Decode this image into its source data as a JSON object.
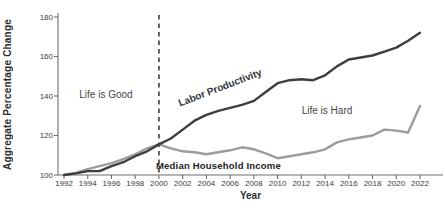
{
  "chart_data": {
    "type": "line",
    "title": "",
    "xlabel": "Year",
    "ylabel": "Aggregate Percentage Change",
    "xlim": [
      1992,
      2022
    ],
    "ylim": [
      100,
      180
    ],
    "grid": false,
    "legend": "inline-labels",
    "xticks": [
      1992,
      1994,
      1996,
      1998,
      2000,
      2002,
      2004,
      2006,
      2008,
      2010,
      2012,
      2014,
      2016,
      2018,
      2020,
      2022
    ],
    "yticks": [
      100,
      120,
      140,
      160,
      180
    ],
    "x": [
      1992,
      1993,
      1994,
      1995,
      1996,
      1997,
      1998,
      1999,
      2000,
      2001,
      2002,
      2003,
      2004,
      2005,
      2006,
      2007,
      2008,
      2009,
      2010,
      2011,
      2012,
      2013,
      2014,
      2015,
      2016,
      2017,
      2018,
      2019,
      2020,
      2021,
      2022
    ],
    "series": [
      {
        "name": "Labor Productivity",
        "color": "#3b3e43",
        "values": [
          100,
          100.8,
          102,
          102,
          104.5,
          106.5,
          109.5,
          112,
          115.5,
          118.5,
          123,
          127.5,
          130.5,
          132.5,
          134,
          135.5,
          137.5,
          142,
          146.5,
          148,
          148.5,
          148,
          150.5,
          155,
          158.5,
          159.5,
          160.5,
          162.5,
          164.5,
          168,
          172
        ]
      },
      {
        "name": "Median Household Income",
        "color": "#9c9c9c",
        "values": [
          100,
          101,
          103,
          104.5,
          106,
          108,
          110.5,
          113.5,
          115.5,
          113.5,
          112,
          111.5,
          110.5,
          111.5,
          112.5,
          114,
          113,
          111,
          108.5,
          109.5,
          110.5,
          111.5,
          113,
          116.5,
          118,
          119,
          120,
          123,
          122.5,
          121.5,
          135
        ]
      }
    ],
    "reference_line": {
      "x": 2000,
      "style": "dashed",
      "color": "#3d3d3d"
    },
    "annotations": [
      {
        "text": "Life is Good",
        "x": 1995.5,
        "y": 140.5
      },
      {
        "text": "Life is Hard",
        "x": 2014.2,
        "y": 132.5
      }
    ]
  }
}
